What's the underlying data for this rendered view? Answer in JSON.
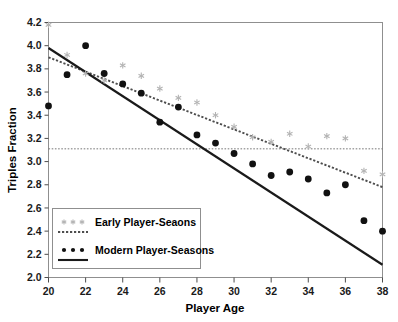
{
  "chart_data": {
    "type": "scatter",
    "title": "",
    "subtitle": "",
    "xlabel": "Player Age",
    "ylabel": "Triples Fraction",
    "xlim": [
      20,
      38
    ],
    "ylim": [
      2.0,
      4.2
    ],
    "xticks": [
      20,
      22,
      24,
      26,
      28,
      30,
      32,
      34,
      36,
      38
    ],
    "xtick_labels": [
      "20",
      "22",
      "24",
      "26",
      "28",
      "30",
      "32",
      "34",
      "36",
      "38"
    ],
    "yticks": [
      2.0,
      2.2,
      2.4,
      2.6,
      2.8,
      3.0,
      3.2,
      3.4,
      3.6,
      3.8,
      4.0,
      4.2
    ],
    "ytick_labels": [
      "2.0",
      "2.2",
      "2.4",
      "2.6",
      "2.8",
      "3.0",
      "3.2",
      "3.4",
      "3.6",
      "3.8",
      "4.0",
      "4.2"
    ],
    "grid": false,
    "legend_position": "bottom-left",
    "x": [
      20,
      21,
      22,
      23,
      24,
      25,
      26,
      27,
      28,
      29,
      30,
      31,
      32,
      33,
      34,
      35,
      36,
      37,
      38
    ],
    "series": [
      {
        "name": "Early Player-Seaons",
        "marker": "asterisk",
        "color": "#b3b3b3",
        "linestyle": "dotted",
        "values": [
          4.18,
          3.92,
          3.76,
          3.7,
          3.83,
          3.74,
          3.63,
          3.55,
          3.51,
          3.4,
          3.3,
          3.21,
          3.17,
          3.24,
          3.13,
          3.22,
          3.2,
          2.92,
          2.89
        ],
        "fit_line": {
          "name": "Early fit",
          "color": "#4d4d4d",
          "linestyle": "dotted",
          "x": [
            20,
            38
          ],
          "y": [
            3.9,
            2.78
          ]
        }
      },
      {
        "name": "Modern Player-Seasons",
        "marker": "circle",
        "color": "#111111",
        "linestyle": "solid",
        "values": [
          3.48,
          3.75,
          4.0,
          3.76,
          3.67,
          3.59,
          3.34,
          3.47,
          3.23,
          3.16,
          3.07,
          2.98,
          2.88,
          2.91,
          2.85,
          2.73,
          2.8,
          2.49,
          2.4
        ],
        "fit_line": {
          "name": "Modern fit",
          "color": "#1a1a1a",
          "linestyle": "solid",
          "x": [
            20,
            38
          ],
          "y": [
            3.98,
            2.11
          ]
        }
      }
    ],
    "reference_lines": [
      {
        "name": "horizontal-reference",
        "orientation": "horizontal",
        "value": 3.11,
        "color": "#777777",
        "linestyle": "dotted"
      }
    ]
  },
  "legend": {
    "entries": [
      {
        "label": "Early Player-Seaons",
        "marker": "asterisk",
        "marker_color": "#b3b3b3",
        "line_color": "#4d4d4d",
        "linestyle": "dotted"
      },
      {
        "label": "Modern Player-Seasons",
        "marker": "circle",
        "marker_color": "#111111",
        "line_color": "#1a1a1a",
        "linestyle": "solid"
      }
    ]
  },
  "colors": {
    "background": "#ffffff",
    "frame": "#8f8f8f",
    "text": "#000000",
    "early_marker": "#b3b3b3",
    "modern_marker": "#111111",
    "reference_line": "#777777"
  }
}
